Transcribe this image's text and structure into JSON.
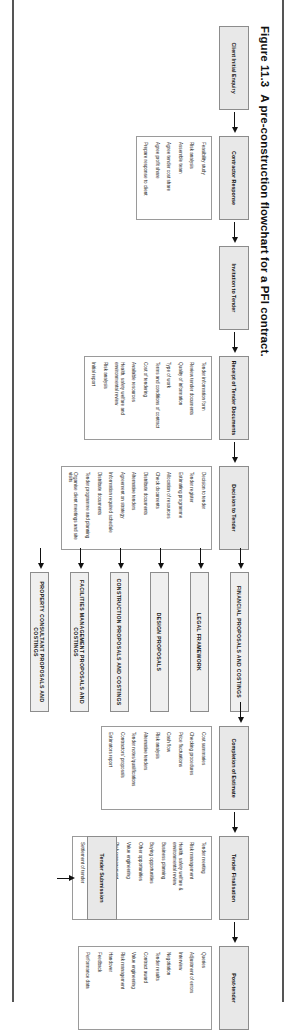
{
  "caption": {
    "number": "Figure 11.3",
    "text": "A pre-construction flowchart for a PFI contract."
  },
  "diagram": {
    "type": "flowchart",
    "orientation": "left-to-right",
    "stages": [
      {
        "id": "client-initial-enquiry",
        "title": "Client Initial Enquiry",
        "items": []
      },
      {
        "id": "contractor-response",
        "title": "Contractor Response",
        "items": [
          "Feasibility study",
          "Risk analysis",
          "Assemble team",
          "Agree tender cost share",
          "Agree profit share",
          "Prepare response to client"
        ]
      },
      {
        "id": "invitation-to-tender",
        "title": "Invitation to Tender",
        "items": []
      },
      {
        "id": "receipt-of-tender-documents",
        "title": "Receipt of Tender Documents",
        "items": [
          "Tender information form",
          "Review tender documents",
          "Quality of information",
          "Type of work",
          "Terms and conditions of contract",
          "Cost of tendering",
          "Available resources",
          "Health, safety welfare and environmental review",
          "Risk analysis",
          "Initial report"
        ]
      },
      {
        "id": "decision-to-tender",
        "title": "Decision to Tender",
        "items": [
          "Decision to tender",
          "Tender register",
          "Estimating programme",
          "Allocation of resources",
          "Check documents",
          "Distribute documents",
          "Alternative tenders",
          "Agreement on strategy",
          "Information required schedule",
          "Distribute documents",
          "Tender programme and planning",
          "Organise client meetings and site visits"
        ]
      },
      {
        "id": "completion-of-estimate",
        "title": "Completion of Estimate",
        "items": [
          "Cost summaries",
          "Checking procedures",
          "Price fluctuations",
          "Cash flow",
          "Risk analysis",
          "Alternative tenders",
          "Tender notes/qualifications",
          "Contractors' proposals",
          "Estimators report"
        ]
      },
      {
        "id": "tender-finalisation",
        "title": "Tender Finalisation",
        "items": [
          "Tender meeting",
          "Risk management",
          "Health, safety welfare & environmental review",
          "Business planning",
          "Buying opportunities",
          "Other opportunities",
          "Value engineering",
          "Risk management",
          "Alternative tenders",
          "Agreement on strategy",
          "Settlement of tender"
        ]
      },
      {
        "id": "post-tender",
        "title": "Post-tender",
        "items": [
          "Queries",
          "Adjustment of errors",
          "Interview",
          "Negotiation",
          "Tender results",
          "Contract award",
          "Value engineering",
          "Risk management",
          "Handover",
          "Feedback",
          "Performance data"
        ]
      }
    ],
    "bands": [
      {
        "id": "financial-proposals-and-costings",
        "label": "FINANCIAL PROPOSALS AND COSTINGS"
      },
      {
        "id": "legal-framework",
        "label": "LEGAL FRAMEWORK"
      },
      {
        "id": "design-proposals",
        "label": "DESIGN PROPOSALS"
      },
      {
        "id": "construction-proposals-and-costings",
        "label": "CONSTRUCTION PROPOSALS AND COSTINGS"
      },
      {
        "id": "facilities-management-proposals-and-costings",
        "label": "FACILITIES MANAGEMENT PROPOSALS AND COSTINGS"
      },
      {
        "id": "property-consultant-proposals-and-costings",
        "label": "PROPERTY CONSULTANT PROPOSALS AND COSTINGS"
      }
    ],
    "submission": {
      "id": "tender-submission",
      "label": "Tender Submission"
    }
  }
}
